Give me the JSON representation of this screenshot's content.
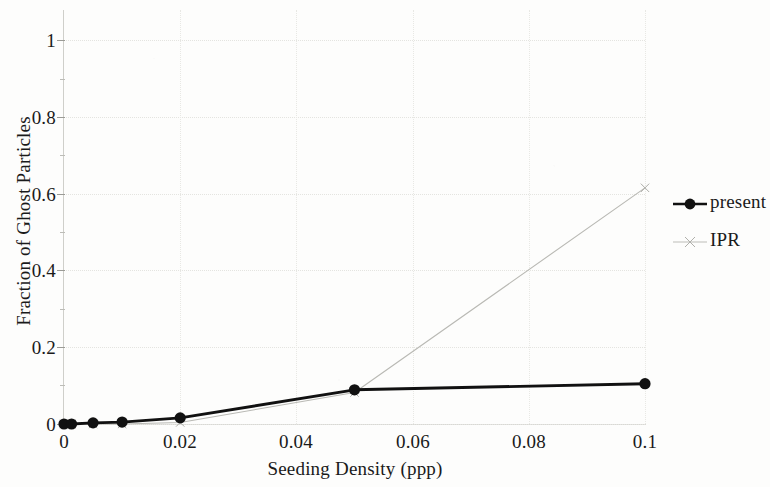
{
  "chart_data": {
    "type": "line",
    "title": "",
    "xlabel": "Seeding Density (ppp)",
    "ylabel": "Fraction of Ghost Particles",
    "xlim": [
      0,
      0.1
    ],
    "ylim": [
      0,
      1.05
    ],
    "xticks": [
      "0",
      "0.02",
      "0.04",
      "0.06",
      "0.08",
      "0.1"
    ],
    "xtick_values": [
      0,
      0.02,
      0.04,
      0.06,
      0.08,
      0.1
    ],
    "yticks": [
      "0",
      "0.2",
      "0.4",
      "0.6",
      "0.8",
      "1"
    ],
    "ytick_values": [
      0,
      0.2,
      0.4,
      0.6,
      0.8,
      1
    ],
    "grid": true,
    "legend_position": "right",
    "series": [
      {
        "name": "present",
        "color": "#111111",
        "marker": "filled-circle",
        "line_style": "solid",
        "x": [
          0,
          0.0013,
          0.005,
          0.01,
          0.02,
          0.05,
          0.1
        ],
        "values": [
          0.0,
          0.0,
          0.003,
          0.005,
          0.016,
          0.089,
          0.105
        ]
      },
      {
        "name": "IPR",
        "color": "#b9b9b4",
        "marker": "x",
        "line_style": "solid-thin",
        "x": [
          0,
          0.0013,
          0.005,
          0.01,
          0.02,
          0.05,
          0.1
        ],
        "values": [
          0.0,
          0.0,
          0.0,
          0.0,
          0.004,
          0.082,
          0.615
        ]
      }
    ]
  },
  "legend": {
    "entries": [
      {
        "label": "present"
      },
      {
        "label": "IPR"
      }
    ]
  },
  "axes": {
    "x_title": "Seeding Density (ppp)",
    "y_title": "Fraction of Ghost Particles",
    "x_tick_labels": [
      "0",
      "0.02",
      "0.04",
      "0.06",
      "0.08",
      "0.1"
    ],
    "y_tick_labels": [
      "0",
      "0.2",
      "0.4",
      "0.6",
      "0.8",
      "1"
    ]
  }
}
